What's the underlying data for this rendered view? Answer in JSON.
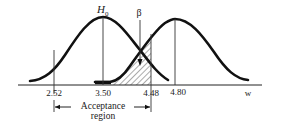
{
  "figure": {
    "hypothesis_label": "H",
    "hypothesis_subscript": "0",
    "beta_label": "β",
    "axis_variable": "w",
    "ticks": [
      {
        "value": "2.52",
        "x": 54
      },
      {
        "value": "3.50",
        "x": 103
      },
      {
        "value": "4.48",
        "x": 151
      },
      {
        "value": "4.80",
        "x": 178
      }
    ],
    "region_label_line1": "Acceptance",
    "region_label_line2": "region",
    "colors": {
      "ink": "#111111",
      "thin_line": "#333333",
      "hatch": "#444444",
      "background": "#ffffff"
    }
  }
}
